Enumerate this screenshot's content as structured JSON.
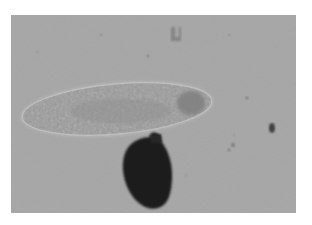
{
  "image": {
    "kind": "micrograph",
    "description": "Grayscale light micrograph of an elongated ciliate (paramecium-like) with a dark opaque body attached beneath it",
    "background_color": "#a5a5a5",
    "frame_color": "#ffffff",
    "subjects": [
      {
        "name": "ciliate-cell",
        "shape": "elongated ellipse",
        "color": "#9a9a9a",
        "bbox": [
          40,
          80,
          230,
          137
        ]
      },
      {
        "name": "dark-mass",
        "shape": "ovoid blob",
        "color": "#202020",
        "bbox": [
          120,
          133,
          172,
          208
        ]
      },
      {
        "name": "debris-speck-right",
        "color": "#404040",
        "center": [
          272,
          128
        ]
      },
      {
        "name": "debris-particle-top",
        "color": "#7a7a7a",
        "center": [
          175,
          33
        ]
      }
    ]
  }
}
